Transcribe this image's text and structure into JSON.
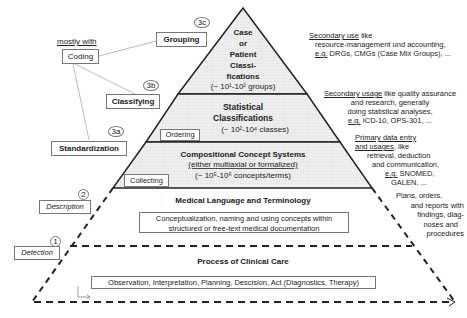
{
  "pyramid": {
    "tier_top": {
      "lines": [
        "Case",
        "or",
        "Patient",
        "Classi-",
        "fications"
      ],
      "count": "(~ 10¹-10² groups)"
    },
    "tier_statistical": {
      "lines": [
        "Statistical",
        "Classifications"
      ],
      "count": "(~ 10²-10⁴ classes)"
    },
    "tier_compositional": {
      "title": "Compositional Concept Systems",
      "subtitle": "(either multiaxial or formalized)",
      "count": "(~ 10⁵-10⁶ concepts/terms)"
    },
    "tier_language": {
      "title": "Medical Language and Terminology",
      "box_lines": [
        "Conceptualization, naming and using concepts within",
        "structured or free-text medical documentation"
      ]
    },
    "tier_clinical": {
      "title": "Process of Clinical Care",
      "box_text": "Observation, Interpretation, Planning, Descision, Act (Diagnostics, Therapy)"
    },
    "fill_color": "#ececec",
    "line_color": "#222222"
  },
  "left_labels": {
    "mostly_with": "mostly with",
    "coding": "Coding",
    "grouping": {
      "label": "Grouping",
      "step": "3c"
    },
    "classifying": {
      "label": "Classifying",
      "step": "3b"
    },
    "standardization": {
      "label": "Standardization",
      "step": "3a"
    },
    "description": {
      "label": "Description",
      "step": "2"
    },
    "detection": {
      "label": "Detection",
      "step": "1"
    },
    "ordering": "Ordering",
    "collecting": "Collecting"
  },
  "right_labels": {
    "top": {
      "underlined": "Secondary use",
      "lines": [
        " like",
        "resource-management und accounting,",
        "DRGs, CMGs (Case Mix Groups), ..."
      ],
      "eg": "e.g."
    },
    "statistical": {
      "underlined": "Secondary usage",
      "lines": [
        " like quality assurance",
        "and research, generally",
        "doing statistical analyses,",
        " ICD-10, OPS-301, ..."
      ],
      "eg": "e.g."
    },
    "compositional": {
      "underlined_1": "Primary data entry",
      "underlined_2": "and usages",
      "lines": [
        ", like",
        "retrieval, deduction",
        "and communication,",
        " SNOMED,",
        "GALEN, ..."
      ],
      "eg": "e.g."
    },
    "language": {
      "lines": [
        "Plans, orders,",
        "and reports with",
        "findings, diag-",
        "noses and",
        "procedures"
      ]
    }
  }
}
